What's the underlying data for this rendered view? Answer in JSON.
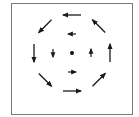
{
  "diagram": {
    "title": "",
    "type": "vector-field",
    "rotation_direction": "counterclockwise",
    "colors": {
      "frame": "#7a7a7a",
      "arrow": "#1a1a1a",
      "center": "#111111",
      "background": "#ffffff"
    },
    "center_point": {
      "label": "center"
    },
    "rings": [
      {
        "name": "outer",
        "magnitude": "large",
        "vectors": [
          {
            "position": "top",
            "direction": "left"
          },
          {
            "position": "top-right",
            "direction": "up-left"
          },
          {
            "position": "right",
            "direction": "up"
          },
          {
            "position": "bottom-right",
            "direction": "up-right"
          },
          {
            "position": "bottom",
            "direction": "right"
          },
          {
            "position": "bottom-left",
            "direction": "down-right"
          },
          {
            "position": "left",
            "direction": "down"
          },
          {
            "position": "top-left",
            "direction": "down-left"
          }
        ]
      },
      {
        "name": "inner",
        "magnitude": "small",
        "vectors": [
          {
            "position": "top",
            "direction": "left"
          },
          {
            "position": "right",
            "direction": "up"
          },
          {
            "position": "bottom",
            "direction": "right"
          },
          {
            "position": "left",
            "direction": "down"
          }
        ]
      }
    ]
  }
}
